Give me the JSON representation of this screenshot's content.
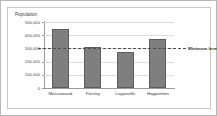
{
  "chart_data": {
    "type": "bar",
    "title": "",
    "xlabel": "",
    "ylabel": "Population",
    "categories": [
      "Mansewood",
      "Paisley",
      "Loganville",
      "Happerfont"
    ],
    "values": [
      450000,
      310000,
      275000,
      375000
    ],
    "ylim": [
      0,
      500000
    ],
    "yticks": [
      0,
      100000,
      200000,
      300000,
      400000,
      500000
    ],
    "ytick_labels": [
      "0",
      "100,000",
      "200,000",
      "300,000",
      "400,000",
      "500,000"
    ],
    "grid": true,
    "legend": "none",
    "annotations": [
      {
        "name": "minimum-level",
        "label": "Minimum level",
        "value": 300000,
        "style": "dashed-horizontal-line"
      }
    ],
    "series_color": "#7f7f7f",
    "threshold_color": "#4f4f4f"
  },
  "axis": {
    "y_title": "Population",
    "ticks": [
      {
        "label": "500,000",
        "value": 500000
      },
      {
        "label": "400,000",
        "value": 400000
      },
      {
        "label": "300,000",
        "value": 300000
      },
      {
        "label": "200,000",
        "value": 200000
      },
      {
        "label": "100,000",
        "value": 100000
      },
      {
        "label": "0",
        "value": 0
      }
    ]
  },
  "bars": [
    {
      "label": "Mansewood",
      "value": 450000
    },
    {
      "label": "Paisley",
      "value": 310000
    },
    {
      "label": "Loganville",
      "value": 275000
    },
    {
      "label": "Happerfont",
      "value": 375000
    }
  ],
  "threshold": {
    "label": "Minimum level",
    "value": 300000
  }
}
